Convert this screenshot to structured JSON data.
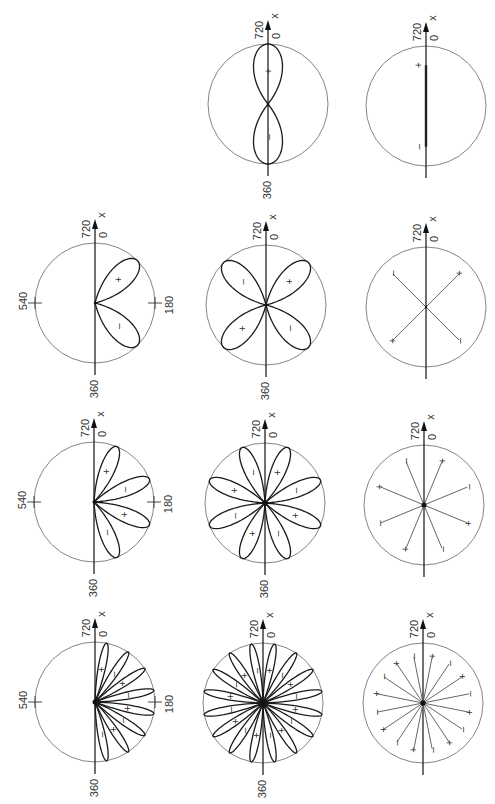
{
  "figure": {
    "axis_labels": {
      "top_left": "720",
      "top_right": "0",
      "arrow": "x",
      "bottom": "360",
      "left": "540",
      "right": "180"
    },
    "sign_plus": "+",
    "sign_minus": "–",
    "radius": 60,
    "panels": [
      {
        "id": "c1r2",
        "col": 1,
        "row": 2,
        "cx": 95,
        "cy": 303,
        "type": "lobes",
        "half": true,
        "lobes": 2,
        "start_deg": 45,
        "step_deg": 90,
        "side_ticks": true
      },
      {
        "id": "c1r3",
        "col": 1,
        "row": 3,
        "cx": 94,
        "cy": 502,
        "type": "lobes",
        "half": true,
        "lobes": 4,
        "start_deg": 22.5,
        "step_deg": 45,
        "side_ticks": true
      },
      {
        "id": "c1r4",
        "col": 1,
        "row": 4,
        "cx": 95,
        "cy": 702,
        "type": "lobes",
        "half": true,
        "lobes": 8,
        "start_deg": 11.25,
        "step_deg": 22.5,
        "side_ticks": true
      },
      {
        "id": "c2r1",
        "col": 2,
        "row": 1,
        "cx": 268,
        "cy": 104,
        "type": "lobes",
        "half": false,
        "lobes": 2,
        "start_deg": 0,
        "step_deg": 180,
        "side_ticks": false,
        "fat": true
      },
      {
        "id": "c2r2",
        "col": 2,
        "row": 2,
        "cx": 266,
        "cy": 305,
        "type": "lobes",
        "half": false,
        "lobes": 4,
        "start_deg": 45,
        "step_deg": 90,
        "side_ticks": false
      },
      {
        "id": "c2r3",
        "col": 2,
        "row": 3,
        "cx": 265,
        "cy": 503,
        "type": "lobes",
        "half": false,
        "lobes": 8,
        "start_deg": 22.5,
        "step_deg": 45,
        "side_ticks": false
      },
      {
        "id": "c2r4",
        "col": 2,
        "row": 4,
        "cx": 263,
        "cy": 703,
        "type": "lobes",
        "half": false,
        "lobes": 16,
        "start_deg": 11.25,
        "step_deg": 22.5,
        "side_ticks": false
      },
      {
        "id": "c3r1",
        "col": 3,
        "row": 1,
        "cx": 426,
        "cy": 106,
        "type": "line",
        "half": false,
        "lobes": 2,
        "start_deg": 0,
        "step_deg": 180,
        "side_ticks": false
      },
      {
        "id": "c3r2",
        "col": 3,
        "row": 2,
        "cx": 426,
        "cy": 307,
        "type": "rays",
        "half": false,
        "lobes": 4,
        "start_deg": 45,
        "step_deg": 90,
        "side_ticks": false
      },
      {
        "id": "c3r3",
        "col": 3,
        "row": 3,
        "cx": 424,
        "cy": 505,
        "type": "rays",
        "half": false,
        "lobes": 8,
        "start_deg": 22.5,
        "step_deg": 45,
        "side_ticks": false
      },
      {
        "id": "c3r4",
        "col": 3,
        "row": 4,
        "cx": 423,
        "cy": 703,
        "type": "rays",
        "half": false,
        "lobes": 16,
        "start_deg": 11.25,
        "step_deg": 22.5,
        "side_ticks": false
      }
    ]
  }
}
